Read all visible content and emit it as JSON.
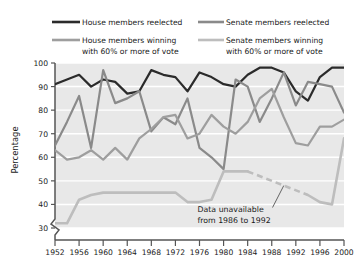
{
  "chart_data": {
    "type": "line",
    "title": "",
    "xlabel": "",
    "ylabel": "Percentage",
    "xlim": [
      1952,
      2000
    ],
    "ylim": [
      30,
      100
    ],
    "y_ticks": [
      30,
      40,
      50,
      60,
      70,
      80,
      90,
      100
    ],
    "x_ticks": [
      1952,
      1956,
      1960,
      1964,
      1968,
      1972,
      1976,
      1980,
      1984,
      1988,
      1992,
      1996,
      2000
    ],
    "y_axis_break": true,
    "grid": "horizontal",
    "legend_position": "top",
    "plot_background": "#e8e8e8",
    "gridline_color": "#ffffff",
    "x": [
      1952,
      1954,
      1956,
      1958,
      1960,
      1962,
      1964,
      1966,
      1968,
      1970,
      1972,
      1974,
      1976,
      1978,
      1980,
      1982,
      1984,
      1986,
      1988,
      1990,
      1992,
      1994,
      1996,
      1998,
      2000
    ],
    "series": [
      {
        "name": "House members reelected",
        "color": "#2b2b2b",
        "width": 2.2,
        "values": [
          91,
          93,
          95,
          90,
          93,
          92,
          87,
          88,
          97,
          95,
          94,
          88,
          96,
          94,
          91,
          90,
          95,
          98,
          98,
          96,
          88,
          84,
          94,
          98,
          98
        ]
      },
      {
        "name": "Senate members reelected",
        "color": "#8a8a8a",
        "width": 2.2,
        "values": [
          65,
          75,
          86,
          64,
          97,
          83,
          85,
          88,
          71,
          77,
          74,
          85,
          64,
          60,
          55,
          93,
          90,
          75,
          85,
          96,
          82,
          92,
          91,
          90,
          79
        ]
      },
      {
        "name": "House members winning with 60% or more of vote",
        "color": "#9e9e9e",
        "width": 2.2,
        "values": [
          63,
          59,
          60,
          63,
          59,
          64,
          59,
          68,
          72,
          77,
          78,
          68,
          70,
          78,
          73,
          70,
          75,
          85,
          89,
          77,
          66,
          65,
          73,
          73,
          76
        ]
      },
      {
        "name": "Senate members winning with 60% or more of vote",
        "color": "#bdbdbd",
        "width": 2.6,
        "values": [
          32,
          32,
          42,
          44,
          45,
          45,
          45,
          45,
          45,
          45,
          45,
          41,
          41,
          42,
          54,
          54,
          54,
          null,
          null,
          null,
          null,
          44,
          41,
          40,
          68
        ]
      }
    ],
    "dashed_gap": {
      "series": "Senate members winning with 60% or more of vote",
      "from_x": 1984,
      "to_x": 1994,
      "from_y": 54,
      "to_y": 44
    },
    "annotations": [
      {
        "text_line1": "Data unavailable",
        "text_line2": "from 1986 to 1992",
        "x": 1978,
        "y": 37,
        "leader_to_x": 1990,
        "leader_to_y": 48
      }
    ]
  },
  "legend": {
    "items": [
      {
        "label": "House members reelected",
        "label2": "",
        "color": "#2b2b2b"
      },
      {
        "label": "Senate members reelected",
        "label2": "",
        "color": "#8a8a8a"
      },
      {
        "label": "House members winning",
        "label2": "with 60% or more of vote",
        "color": "#9e9e9e"
      },
      {
        "label": "Senate members winning",
        "label2": "with 60% or more of vote",
        "color": "#bdbdbd"
      }
    ]
  },
  "axes": {
    "y_title": "Percentage",
    "y_tick_labels": [
      "100",
      "90",
      "80",
      "70",
      "60",
      "50",
      "40",
      "30"
    ],
    "x_tick_labels": [
      "1952",
      "1956",
      "1960",
      "1964",
      "1968",
      "1972",
      "1976",
      "1980",
      "1984",
      "1988",
      "1992",
      "1996",
      "2000"
    ]
  },
  "annotation": {
    "line1": "Data unavailable",
    "line2": "from 1986 to 1992"
  }
}
